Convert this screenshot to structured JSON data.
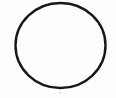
{
  "image": {
    "kind": "scanned-line-drawing",
    "subject": "circle-outline",
    "alt_text": "A single hand-drawn black circle outline on a white background",
    "width": 116,
    "height": 98,
    "background_color": "#fdfdfd",
    "paper_tint": "#ffffff"
  },
  "shapes": {
    "circle": {
      "name": "circle-outline",
      "center_x": 60.5,
      "center_y": 45.5,
      "radius_x": 45.0,
      "radius_y": 42.5,
      "stroke_color": "#171717",
      "stroke_width": 2.4,
      "fill": "none",
      "bounds": {
        "left": 15,
        "top": 3,
        "right": 106,
        "bottom": 88
      },
      "style": "hand-drawn, slightly irregular, closed loop"
    },
    "speck": {
      "name": "ink-speck",
      "x": 60,
      "y": 93,
      "radius": 1.2,
      "color": "#c9c9c9",
      "opacity": 0.55
    }
  },
  "noise": {
    "top_left_smudge": {
      "x": 8,
      "y": 8,
      "opacity": 0.03
    },
    "interior_tint": {
      "color": "#ffffff",
      "opacity": 1
    }
  }
}
